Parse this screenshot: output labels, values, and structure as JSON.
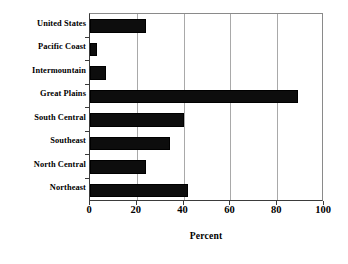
{
  "chart_data": {
    "type": "bar",
    "orientation": "horizontal",
    "title": "",
    "xlabel": "Percent",
    "ylabel": "",
    "xlim": [
      0,
      100
    ],
    "xticks": [
      0,
      20,
      40,
      60,
      80,
      100
    ],
    "grid": true,
    "legend": false,
    "categories": [
      "United States",
      "Pacific Coast",
      "Intermountain",
      "Great Plains",
      "South Central",
      "Southeast",
      "North Central",
      "Northeast"
    ],
    "values": [
      24,
      3,
      7,
      89,
      40,
      34,
      24,
      42
    ],
    "bar_color": "#0d0d0d"
  },
  "axis": {
    "x_tick_labels": [
      "0",
      "20",
      "40",
      "60",
      "80",
      "100"
    ],
    "x_title": "Percent"
  },
  "colors": {
    "bar": "#0d0d0d",
    "grid": "#a9a9a9",
    "axis": "#3b3b3b",
    "background": "#ffffff",
    "text": "#000000"
  }
}
